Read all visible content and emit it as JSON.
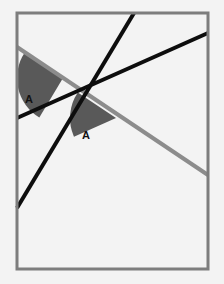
{
  "figure": {
    "type": "geometry-diagram",
    "canvas": {
      "width": 224,
      "height": 284
    },
    "background": {
      "color": "#f3f3f3",
      "texture": "paper-noise",
      "name": "paper-background"
    },
    "frame": {
      "name": "diagram-border",
      "x": 17,
      "y": 13,
      "width": 191,
      "height": 256,
      "stroke": "#7d7d7d",
      "stroke_width": 3
    },
    "lines": [
      {
        "name": "parallel-line-1",
        "role": "parallel",
        "color": "#0d0d0d",
        "stroke_width": 4,
        "x1": 17,
        "y1": 208,
        "x2": 134,
        "y2": 13
      },
      {
        "name": "parallel-line-2",
        "role": "parallel",
        "color": "#0d0d0d",
        "stroke_width": 4,
        "x1": 17,
        "y1": 118,
        "x2": 208,
        "y2": 33
      },
      {
        "name": "transversal-line",
        "role": "transversal",
        "color": "#8c8c8c",
        "stroke_width": 4,
        "x1": 17,
        "y1": 47,
        "x2": 208,
        "y2": 175
      }
    ],
    "intersections": [
      {
        "name": "intersection-upper",
        "x": 63,
        "y": 78
      },
      {
        "name": "intersection-lower",
        "x": 116,
        "y": 118
      }
    ],
    "angles": [
      {
        "name": "angle-a-upper",
        "label": "A",
        "vertex_x": 63,
        "vertex_y": 78,
        "radius": 46,
        "fill": "#595959",
        "label_x": 25,
        "label_y": 103
      },
      {
        "name": "angle-a-lower",
        "label": "A",
        "vertex_x": 116,
        "vertex_y": 118,
        "radius": 46,
        "fill": "#595959",
        "label_x": 82,
        "label_y": 139
      }
    ],
    "colors": {
      "line_dark": "#0d0d0d",
      "line_gray": "#8c8c8c",
      "border": "#7d7d7d",
      "angle_fill": "#595959",
      "label_text": "#111111",
      "background": "#f3f3f3"
    }
  }
}
